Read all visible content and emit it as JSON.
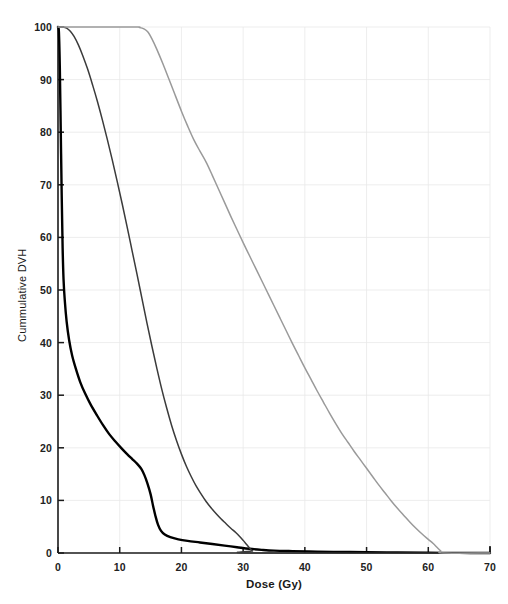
{
  "chart_data": {
    "type": "line",
    "title": "",
    "subtitle": "",
    "xlabel": "Dose (Gy)",
    "ylabel": "Cummulative DVH",
    "xlim": [
      0,
      70
    ],
    "ylim": [
      0,
      100
    ],
    "xticks": [
      0,
      10,
      20,
      30,
      40,
      50,
      60,
      70
    ],
    "yticks": [
      0,
      10,
      20,
      30,
      40,
      50,
      60,
      70,
      80,
      90,
      100
    ],
    "xtick_labels": [
      "0",
      "10",
      "20",
      "30",
      "40",
      "50",
      "60",
      "70"
    ],
    "ytick_labels": [
      "0",
      "10",
      "20",
      "30",
      "40",
      "50",
      "60",
      "70",
      "80",
      "90",
      "100"
    ],
    "grid": true,
    "grid_color": "#e8e8e8",
    "legend": "none",
    "axis_color": "#1a1a1a",
    "series": [
      {
        "name": "Curve A (thick black, steep early fall-off)",
        "color": "#000000",
        "width": 2.4,
        "points": [
          [
            0.0,
            100.0
          ],
          [
            0.15,
            99.0
          ],
          [
            0.3,
            92.0
          ],
          [
            0.45,
            80.0
          ],
          [
            0.6,
            68.0
          ],
          [
            0.75,
            58.0
          ],
          [
            0.9,
            52.0
          ],
          [
            1.1,
            48.0
          ],
          [
            1.4,
            44.0
          ],
          [
            1.8,
            40.5
          ],
          [
            2.3,
            37.5
          ],
          [
            2.9,
            35.0
          ],
          [
            3.6,
            32.5
          ],
          [
            4.4,
            30.3
          ],
          [
            5.3,
            28.2
          ],
          [
            6.3,
            26.2
          ],
          [
            7.3,
            24.3
          ],
          [
            8.3,
            22.6
          ],
          [
            9.3,
            21.2
          ],
          [
            10.3,
            19.9
          ],
          [
            11.2,
            18.8
          ],
          [
            12.0,
            17.9
          ],
          [
            12.8,
            17.0
          ],
          [
            13.5,
            16.0
          ],
          [
            14.0,
            14.8
          ],
          [
            14.5,
            13.2
          ],
          [
            15.0,
            11.2
          ],
          [
            15.4,
            9.0
          ],
          [
            15.8,
            7.0
          ],
          [
            16.2,
            5.4
          ],
          [
            16.7,
            4.2
          ],
          [
            17.3,
            3.5
          ],
          [
            18.2,
            3.0
          ],
          [
            19.5,
            2.6
          ],
          [
            21.0,
            2.3
          ],
          [
            23.0,
            2.0
          ],
          [
            25.0,
            1.7
          ],
          [
            27.0,
            1.4
          ],
          [
            29.0,
            1.1
          ],
          [
            31.0,
            0.8
          ],
          [
            33.0,
            0.6
          ],
          [
            35.0,
            0.45
          ],
          [
            38.0,
            0.35
          ],
          [
            42.0,
            0.25
          ],
          [
            46.0,
            0.2
          ],
          [
            50.0,
            0.15
          ],
          [
            55.0,
            0.1
          ],
          [
            60.0,
            0.05
          ],
          [
            65.0,
            0.02
          ],
          [
            70.0,
            0.0
          ]
        ]
      },
      {
        "name": "Curve B (dark gray, mid fall-off)",
        "color": "#3b3b3b",
        "width": 1.5,
        "points": [
          [
            0.0,
            100.0
          ],
          [
            0.8,
            100.0
          ],
          [
            1.4,
            99.8
          ],
          [
            2.0,
            99.2
          ],
          [
            2.6,
            98.2
          ],
          [
            3.3,
            96.6
          ],
          [
            4.0,
            94.6
          ],
          [
            4.8,
            92.0
          ],
          [
            5.6,
            89.0
          ],
          [
            6.4,
            85.8
          ],
          [
            7.2,
            82.3
          ],
          [
            8.0,
            78.6
          ],
          [
            8.8,
            74.7
          ],
          [
            9.6,
            70.6
          ],
          [
            10.4,
            66.4
          ],
          [
            11.2,
            62.0
          ],
          [
            12.0,
            57.5
          ],
          [
            12.8,
            53.0
          ],
          [
            13.6,
            48.4
          ],
          [
            14.4,
            43.8
          ],
          [
            15.2,
            39.4
          ],
          [
            16.0,
            35.2
          ],
          [
            16.8,
            31.2
          ],
          [
            17.6,
            27.6
          ],
          [
            18.4,
            24.3
          ],
          [
            19.2,
            21.4
          ],
          [
            20.0,
            18.8
          ],
          [
            20.8,
            16.5
          ],
          [
            21.6,
            14.5
          ],
          [
            22.4,
            12.7
          ],
          [
            23.2,
            11.2
          ],
          [
            24.0,
            9.8
          ],
          [
            24.8,
            8.6
          ],
          [
            25.6,
            7.5
          ],
          [
            26.4,
            6.5
          ],
          [
            27.2,
            5.6
          ],
          [
            28.0,
            4.7
          ],
          [
            28.8,
            3.9
          ],
          [
            29.4,
            3.2
          ],
          [
            30.0,
            2.4
          ],
          [
            30.5,
            1.7
          ],
          [
            31.0,
            1.0
          ],
          [
            31.5,
            0.4
          ],
          [
            32.0,
            0.0
          ],
          [
            70.0,
            0.0
          ]
        ]
      },
      {
        "name": "Curve C (light gray, broad high-dose coverage)",
        "color": "#9a9a9a",
        "width": 1.5,
        "points": [
          [
            0.0,
            100.0
          ],
          [
            12.0,
            100.0
          ],
          [
            13.2,
            99.9
          ],
          [
            14.0,
            99.6
          ],
          [
            14.6,
            99.0
          ],
          [
            15.2,
            97.8
          ],
          [
            16.0,
            95.8
          ],
          [
            17.0,
            93.0
          ],
          [
            18.0,
            90.0
          ],
          [
            19.0,
            87.0
          ],
          [
            20.0,
            84.0
          ],
          [
            21.0,
            81.2
          ],
          [
            22.0,
            78.6
          ],
          [
            23.0,
            76.4
          ],
          [
            24.0,
            74.3
          ],
          [
            25.0,
            71.8
          ],
          [
            26.0,
            69.2
          ],
          [
            27.0,
            66.6
          ],
          [
            28.0,
            64.0
          ],
          [
            29.0,
            61.5
          ],
          [
            30.0,
            59.0
          ],
          [
            31.0,
            56.6
          ],
          [
            32.0,
            54.2
          ],
          [
            33.0,
            51.8
          ],
          [
            34.0,
            49.4
          ],
          [
            35.0,
            47.0
          ],
          [
            36.0,
            44.6
          ],
          [
            37.0,
            42.2
          ],
          [
            38.0,
            39.8
          ],
          [
            39.0,
            37.5
          ],
          [
            40.0,
            35.2
          ],
          [
            41.0,
            33.0
          ],
          [
            42.0,
            30.8
          ],
          [
            43.0,
            28.7
          ],
          [
            44.0,
            26.6
          ],
          [
            45.0,
            24.6
          ],
          [
            46.0,
            22.7
          ],
          [
            47.0,
            21.0
          ],
          [
            48.0,
            19.3
          ],
          [
            49.0,
            17.7
          ],
          [
            50.0,
            16.1
          ],
          [
            51.0,
            14.5
          ],
          [
            52.0,
            12.9
          ],
          [
            53.0,
            11.4
          ],
          [
            54.0,
            9.9
          ],
          [
            55.0,
            8.5
          ],
          [
            56.0,
            7.2
          ],
          [
            57.0,
            5.9
          ],
          [
            58.0,
            4.7
          ],
          [
            59.0,
            3.6
          ],
          [
            60.0,
            2.6
          ],
          [
            60.8,
            1.8
          ],
          [
            61.4,
            1.1
          ],
          [
            62.0,
            0.4
          ],
          [
            62.4,
            0.0
          ],
          [
            70.0,
            0.0
          ]
        ]
      }
    ]
  },
  "axes_geometry": {
    "plot_left_px": 58,
    "plot_right_px": 490,
    "plot_top_px": 27,
    "plot_bottom_px": 553
  }
}
